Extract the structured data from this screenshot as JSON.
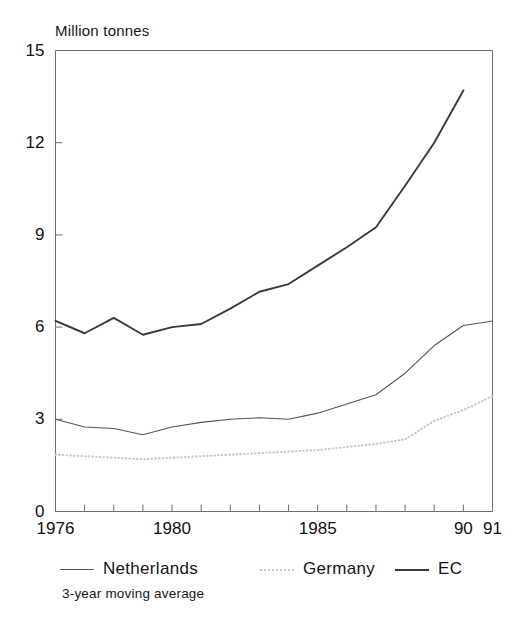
{
  "chart_data": {
    "type": "line",
    "title": "",
    "ylabel": "Million tonnes",
    "xlabel": "",
    "ylim": [
      0,
      15
    ],
    "yticks": [
      0,
      3,
      6,
      9,
      12,
      15
    ],
    "xlim": [
      1976,
      1991
    ],
    "xtick_labels": [
      "1976",
      "1980",
      "1985",
      "90",
      "91"
    ],
    "xtick_values": [
      1976,
      1980,
      1985,
      1990,
      1991
    ],
    "minor_xticks": [
      1977,
      1978,
      1979,
      1981,
      1982,
      1983,
      1984,
      1986,
      1987,
      1988,
      1989
    ],
    "grid": false,
    "legend_position": "below-axes",
    "annotation": "3-year moving average",
    "x": [
      1976,
      1977,
      1978,
      1979,
      1980,
      1981,
      1982,
      1983,
      1984,
      1985,
      1986,
      1987,
      1988,
      1989,
      1990,
      1991
    ],
    "series": [
      {
        "name": "Netherlands",
        "style": "solid-thin",
        "color": "#555555",
        "values": [
          3.0,
          2.75,
          2.7,
          2.5,
          2.75,
          2.9,
          3.0,
          3.05,
          3.0,
          3.2,
          3.5,
          3.8,
          4.5,
          5.4,
          6.05,
          6.2
        ]
      },
      {
        "name": "Germany",
        "style": "dotted",
        "color": "#c9c9c9",
        "values": [
          1.85,
          1.8,
          1.75,
          1.7,
          1.75,
          1.8,
          1.85,
          1.9,
          1.95,
          2.0,
          2.1,
          2.2,
          2.35,
          2.95,
          3.3,
          3.75
        ]
      },
      {
        "name": "EC",
        "style": "solid-thick",
        "color": "#3a3a3a",
        "values": [
          6.2,
          5.8,
          6.3,
          5.75,
          6.0,
          6.1,
          6.6,
          7.15,
          7.4,
          8.0,
          8.6,
          9.25,
          10.6,
          12.0,
          13.7,
          null
        ]
      }
    ]
  },
  "legend": {
    "items": [
      {
        "label": "Netherlands",
        "swatch": "solid-thin"
      },
      {
        "label": "Germany",
        "swatch": "dotted"
      },
      {
        "label": "EC",
        "swatch": "solid-thick"
      }
    ]
  },
  "footnote": {
    "text": "3-year moving average"
  }
}
